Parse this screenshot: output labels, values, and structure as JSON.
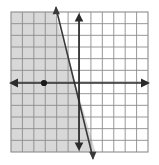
{
  "figure": {
    "kind": "coordinate-grid-inequality-graph",
    "width": 159,
    "height": 165,
    "background_color": "#ffffff"
  },
  "grid": {
    "left": 11,
    "top": 12,
    "right": 148,
    "bottom": 152,
    "columns": 12,
    "rows": 12,
    "cell_width": 11.4,
    "cell_height": 11.7,
    "line_color": "#8c8c8c",
    "line_width": 0.9,
    "label": "square grid"
  },
  "axes": {
    "color": "#2b2b2b",
    "line_width": 1.7,
    "x_axis": {
      "name": "horizontal-axis",
      "y": 83,
      "x_start": 11,
      "x_end": 148,
      "arrow_left": true,
      "arrow_right": true
    },
    "y_axis": {
      "name": "vertical-axis",
      "x": 79,
      "y_start": 14,
      "y_end": 150,
      "arrow_up": true,
      "arrow_down": true
    },
    "origin": {
      "x": 79,
      "y": 83
    }
  },
  "boundary_line": {
    "name": "boundary-line",
    "x1": 56,
    "y1": 8,
    "x2": 93,
    "y2": 158,
    "color": "#3a3a3a",
    "line_width": 1.6,
    "style": "solid",
    "arrow_top": true,
    "arrow_bottom": true,
    "slope_description": "steep negative slope",
    "slope_value": -4.05
  },
  "shaded_region": {
    "name": "solution-shading",
    "side": "left of boundary line",
    "fill_color": "#c9c9c9",
    "opacity": 0.72,
    "polygon": "11,12 54.5,12 95.5,152 11,152"
  },
  "plotted_point": {
    "name": "plotted-point",
    "x": 44,
    "y": 83,
    "radius": 3.1,
    "color": "#1a1a1a",
    "grid_position": "3 units left of origin on the horizontal axis"
  },
  "colors": {
    "grid": "#8c8c8c",
    "axis": "#2b2b2b",
    "line": "#3a3a3a",
    "shade": "#c9c9c9",
    "point": "#1a1a1a",
    "background": "#ffffff"
  }
}
